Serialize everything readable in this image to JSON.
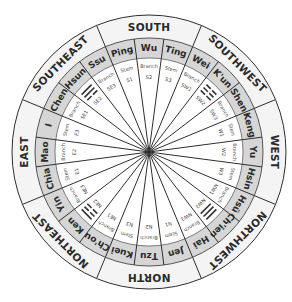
{
  "colors": {
    "background": "#ffffff",
    "outer_ring": "#f4f4f4",
    "name_ring": "#d6d6d6",
    "inner_area": "#ffffff",
    "lines": "#2e2e2e"
  },
  "geometry": {
    "cx": 149,
    "cy": 152,
    "r_outer": 137,
    "r_dir_inner": 114,
    "r_name_inner": 94,
    "r_kind": 86,
    "r_code": 75
  },
  "directions": [
    {
      "label": "SOUTH",
      "angle": 0
    },
    {
      "label": "SOUTHWEST",
      "angle": 45
    },
    {
      "label": "WEST",
      "angle": 90
    },
    {
      "label": "NORTHWEST",
      "angle": 135
    },
    {
      "label": "NORTH",
      "angle": 180
    },
    {
      "label": "NORTHEAST",
      "angle": 225
    },
    {
      "label": "EAST",
      "angle": 270
    },
    {
      "label": "SOUTHEAST",
      "angle": 315
    }
  ],
  "segments": [
    {
      "name": "Wu",
      "kind": "Branch",
      "code": "S2"
    },
    {
      "name": "Ting",
      "kind": "Stem",
      "code": "S3"
    },
    {
      "name": "Wei",
      "kind": "Branch",
      "code": "SW1"
    },
    {
      "name": "K'un",
      "kind": "trigram",
      "code": "SW2",
      "trigram": [
        0,
        0,
        0
      ]
    },
    {
      "name": "Shen",
      "kind": "Branch",
      "code": "SW3"
    },
    {
      "name": "Keng",
      "kind": "Stem",
      "code": "W1"
    },
    {
      "name": "Yu",
      "kind": "Branch",
      "code": "W2"
    },
    {
      "name": "Hsin",
      "kind": "Stem",
      "code": "W3"
    },
    {
      "name": "Hsü",
      "kind": "Branch",
      "code": "NW1"
    },
    {
      "name": "Ch'ien",
      "kind": "trigram",
      "code": "NW2",
      "trigram": [
        1,
        1,
        1
      ]
    },
    {
      "name": "Hai",
      "kind": "Branch",
      "code": "NW3"
    },
    {
      "name": "Jen",
      "kind": "Stem",
      "code": "N1"
    },
    {
      "name": "Tzu",
      "kind": "Branch",
      "code": "N2"
    },
    {
      "name": "Kuei",
      "kind": "Stem",
      "code": "N3"
    },
    {
      "name": "Ch'ou",
      "kind": "Branch",
      "code": "NE1"
    },
    {
      "name": "Ken",
      "kind": "trigram",
      "code": "NE2",
      "trigram": [
        1,
        0,
        0
      ]
    },
    {
      "name": "Yin",
      "kind": "Branch",
      "code": "NE3"
    },
    {
      "name": "Chia",
      "kind": "Stem",
      "code": "E1"
    },
    {
      "name": "Mao",
      "kind": "Branch",
      "code": "E2"
    },
    {
      "name": "I",
      "kind": "Stem",
      "code": "E3"
    },
    {
      "name": "Chen",
      "kind": "Branch",
      "code": "SE1"
    },
    {
      "name": "Hsun",
      "kind": "trigram",
      "code": "SE2",
      "trigram": [
        1,
        1,
        0
      ]
    },
    {
      "name": "Ssu",
      "kind": "Branch",
      "code": "SE3"
    },
    {
      "name": "Ping",
      "kind": "Stem",
      "code": "S1"
    }
  ]
}
